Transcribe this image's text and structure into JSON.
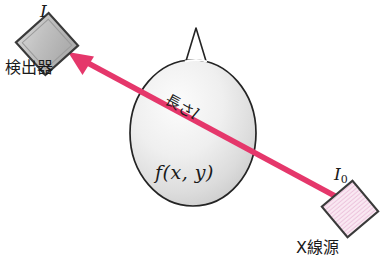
{
  "figure": {
    "background_color": "#ffffff",
    "beam": {
      "color": "#e5376b",
      "direction": "source-to-detector",
      "start_x": 335,
      "start_y": 196,
      "end_x": 68,
      "end_y": 52,
      "arrow_name": "x-ray-beam-arrow"
    },
    "head": {
      "name": "head-phantom-ellipse",
      "outline_color": "#1f1f1f",
      "fill_gradient_light": "#fbfbfb",
      "fill_gradient_dark": "#c6c6c6",
      "nose_name": "nose-triangle"
    },
    "detector": {
      "name": "detector-square",
      "fill_color": "#bfbfbf",
      "border_color": "#3a3a3a",
      "label": "検出器",
      "intensity_label": "I"
    },
    "source": {
      "name": "xray-source-square",
      "fill_color": "#f9e4f0",
      "hatch_color": "#e8b9d6",
      "border_color": "#3a3a3a",
      "label": "X線源",
      "intensity_label": "I",
      "intensity_subscript": "0"
    },
    "annotations": {
      "path_length_prefix": "長さ",
      "path_length_symbol": "l",
      "attenuation_function": "f(x, y)"
    }
  }
}
